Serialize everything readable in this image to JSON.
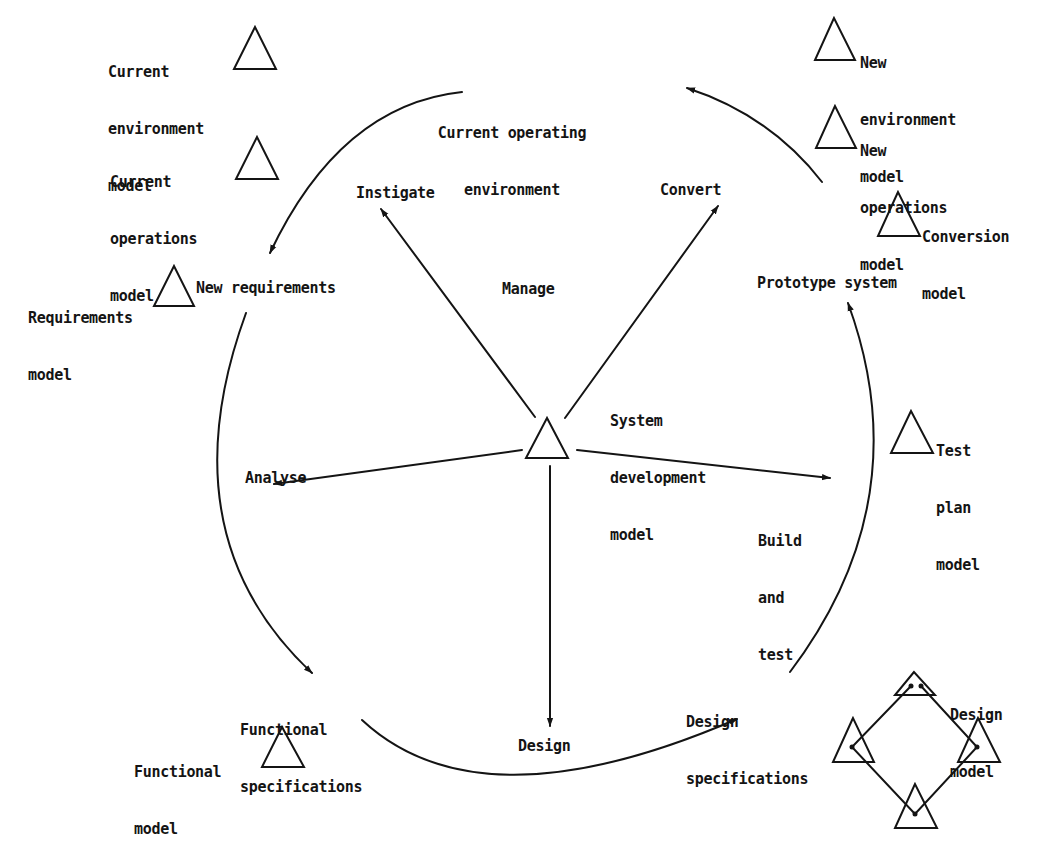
{
  "diagram": {
    "type": "cyclic process diagram",
    "colors": {
      "ink": "#141414",
      "background": "#ffffff"
    },
    "hub": {
      "label": "System development model",
      "label_lines": [
        "System",
        "development",
        "model"
      ],
      "center_label": "Manage",
      "icon": "triangle-icon"
    },
    "spokes": [
      {
        "label": "Instigate",
        "direction": "upper-left"
      },
      {
        "label": "Convert",
        "direction": "upper-right"
      },
      {
        "label": "Analyse",
        "direction": "left"
      },
      {
        "label": "Build and test",
        "label_lines": [
          "Build",
          "and",
          "test"
        ],
        "direction": "right"
      },
      {
        "label": "Design",
        "direction": "down"
      }
    ],
    "cycle_stages": [
      {
        "label": "Current operating environment",
        "label_lines": [
          "Current operating",
          "environment"
        ]
      },
      {
        "label": "New requirements"
      },
      {
        "label": "Functional specifications",
        "label_lines": [
          "Functional",
          "specifications"
        ]
      },
      {
        "label": "Design specifications",
        "label_lines": [
          "Design",
          "specifications"
        ]
      },
      {
        "label": "Prototype system"
      }
    ],
    "cycle_flow": [
      "Prototype system -> Current operating environment",
      "Current operating environment -> New requirements",
      "New requirements -> Functional specifications",
      "Functional specifications -> Design specifications",
      "Design specifications -> Prototype system"
    ],
    "models": [
      {
        "label": "Current environment model",
        "label_lines": [
          "Current",
          "environment",
          "model"
        ]
      },
      {
        "label": "Current operations model",
        "label_lines": [
          "Current",
          "operations",
          "model"
        ]
      },
      {
        "label": "Requirements model",
        "label_lines": [
          "Requirements",
          "model"
        ]
      },
      {
        "label": "Functional model",
        "label_lines": [
          "Functional",
          "model"
        ]
      },
      {
        "label": "New environment model",
        "label_lines": [
          "New",
          "environment",
          "model"
        ]
      },
      {
        "label": "New operations model",
        "label_lines": [
          "New",
          "operations",
          "model"
        ]
      },
      {
        "label": "Conversion model",
        "label_lines": [
          "Conversion",
          "model"
        ]
      },
      {
        "label": "Test plan model",
        "label_lines": [
          "Test",
          "plan",
          "model"
        ]
      },
      {
        "label": "Design model",
        "label_lines": [
          "Design",
          "model"
        ],
        "icon": "four-triangle-network-icon"
      }
    ]
  }
}
